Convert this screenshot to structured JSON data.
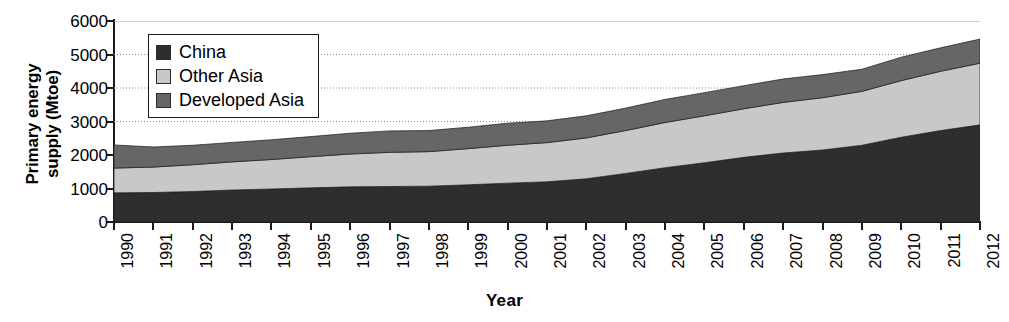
{
  "chart_data": {
    "type": "area",
    "stacked": true,
    "title": "",
    "xlabel": "Year",
    "ylabel": "Primary energy supply (Mtoe)",
    "ylabel_lines": "Primary energy\nsupply (Mtoe)",
    "ylim": [
      0,
      6000
    ],
    "ytick_step": 1000,
    "yticks": [
      6000,
      5000,
      4000,
      3000,
      2000,
      1000,
      0
    ],
    "ytick_labels": [
      "6000",
      "5000",
      "4000",
      "3000",
      "2000",
      "1000",
      "0"
    ],
    "grid": true,
    "grid_style": "dotted-horizontal",
    "legend_position": "top-left-inside",
    "categories": [
      "1990",
      "1991",
      "1992",
      "1993",
      "1994",
      "1995",
      "1996",
      "1997",
      "1998",
      "1999",
      "2000",
      "2001",
      "2002",
      "2003",
      "2004",
      "2005",
      "2006",
      "2007",
      "2008",
      "2009",
      "2010",
      "2011",
      "2012"
    ],
    "x": [
      1990,
      1991,
      1992,
      1993,
      1994,
      1995,
      1996,
      1997,
      1998,
      1999,
      2000,
      2001,
      2002,
      2003,
      2004,
      2005,
      2006,
      2007,
      2008,
      2009,
      2010,
      2011,
      2012
    ],
    "series": [
      {
        "name": "China",
        "color": "#2e2e2e",
        "values": [
          870,
          880,
          910,
          955,
          985,
          1020,
          1050,
          1060,
          1070,
          1110,
          1160,
          1200,
          1290,
          1450,
          1620,
          1770,
          1930,
          2060,
          2150,
          2290,
          2530,
          2730,
          2900
        ]
      },
      {
        "name": "Other Asia",
        "color": "#c8c8c8",
        "values": [
          740,
          760,
          800,
          840,
          880,
          930,
          980,
          1020,
          1030,
          1080,
          1130,
          1170,
          1220,
          1280,
          1350,
          1400,
          1450,
          1510,
          1560,
          1610,
          1690,
          1770,
          1840
        ]
      },
      {
        "name": "Developed Asia",
        "color": "#666666",
        "values": [
          690,
          600,
          580,
          580,
          590,
          600,
          620,
          640,
          630,
          640,
          660,
          650,
          660,
          670,
          690,
          690,
          690,
          700,
          690,
          660,
          700,
          700,
          720
        ]
      }
    ],
    "totals": [
      2300,
      2240,
      2290,
      2375,
      2455,
      2550,
      2650,
      2720,
      2730,
      2830,
      2950,
      3020,
      3170,
      3400,
      3660,
      3860,
      4070,
      4270,
      4400,
      4560,
      4920,
      5200,
      5460
    ]
  },
  "legend": {
    "items": [
      {
        "label": "China",
        "swatch": "#2e2e2e"
      },
      {
        "label": "Other Asia",
        "swatch": "#c8c8c8"
      },
      {
        "label": "Developed Asia",
        "swatch": "#666666"
      }
    ]
  },
  "axes": {
    "x_title": "Year",
    "y_title": "Primary energy\nsupply (Mtoe)"
  }
}
